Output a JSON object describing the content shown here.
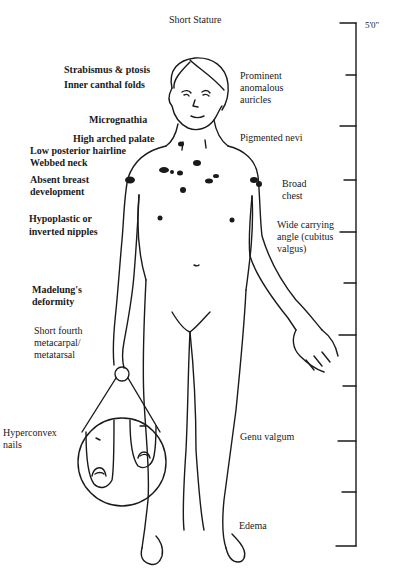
{
  "title": "Short Stature",
  "ruler": {
    "top_label": "5'0\"",
    "ticks": [
      23,
      75,
      126,
      180,
      232,
      283,
      335,
      386,
      441,
      492,
      546
    ]
  },
  "labels_left": [
    {
      "text": "Strabismus & ptosis"
    },
    {
      "text": "Inner canthal folds"
    },
    {
      "text": "Micrognathia"
    },
    {
      "text": "High arched palate"
    },
    {
      "text": "Low posterior hairline"
    },
    {
      "text": "Webbed neck"
    },
    {
      "text": "Absent breast"
    },
    {
      "text": "development"
    },
    {
      "text": "Hypoplastic or"
    },
    {
      "text": "inverted nipples"
    },
    {
      "text": "Madelung's"
    },
    {
      "text": "deformity"
    },
    {
      "text": "Short fourth"
    },
    {
      "text": "metacarpal/"
    },
    {
      "text": "metatarsal"
    },
    {
      "text": "Hyperconvex"
    },
    {
      "text": "nails"
    }
  ],
  "labels_right": [
    {
      "text": "Prominent"
    },
    {
      "text": "anomalous"
    },
    {
      "text": "auricles"
    },
    {
      "text": "Pigmented nevi"
    },
    {
      "text": "Broad"
    },
    {
      "text": "chest"
    },
    {
      "text": "Wide carrying"
    },
    {
      "text": "angle (cubitus"
    },
    {
      "text": "valgus)"
    },
    {
      "text": "Genu valgum"
    },
    {
      "text": "Edema"
    }
  ]
}
